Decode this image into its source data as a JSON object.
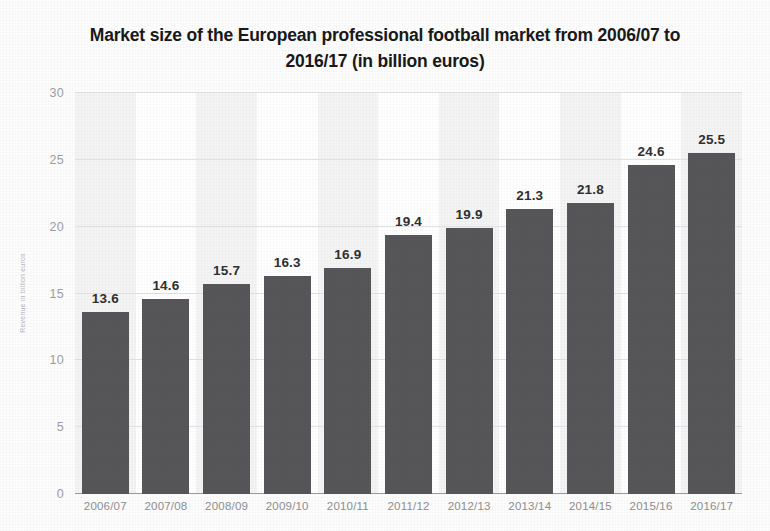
{
  "chart_data": {
    "type": "bar",
    "title": "Market size of the European professional football market from 2006/07 to 2016/17 (in billion euros)",
    "title_line1": "Market size of the European professional football market from 2006/07 to",
    "title_line2": "2016/17 (in billion euros)",
    "xlabel": "",
    "ylabel": "Revenue in billion euros",
    "categories": [
      "2006/07",
      "2007/08",
      "2008/09",
      "2009/10",
      "2010/11",
      "2011/12",
      "2012/13",
      "2013/14",
      "2014/15",
      "2015/16",
      "2016/17"
    ],
    "values": [
      13.6,
      14.6,
      15.7,
      16.3,
      16.9,
      19.4,
      19.9,
      21.3,
      21.8,
      24.6,
      25.5
    ],
    "value_labels": [
      "13.6",
      "14.6",
      "15.7",
      "16.3",
      "16.9",
      "19.4",
      "19.9",
      "21.3",
      "21.8",
      "24.6",
      "25.5"
    ],
    "ylim": [
      0,
      30
    ],
    "yticks": [
      0,
      5,
      10,
      15,
      20,
      25,
      30
    ],
    "ytick_labels": [
      "0",
      "5",
      "10",
      "15",
      "20",
      "25",
      "30"
    ],
    "grid": true,
    "legend": false,
    "legend_position": "none",
    "bar_color": "#555558",
    "band_color": "#f4f4f5",
    "gridline_color": "#e2e2e4",
    "axis_color": "#9a9a9a",
    "label_color": "#2e2e2e",
    "tick_color": "#9d9d9f"
  }
}
